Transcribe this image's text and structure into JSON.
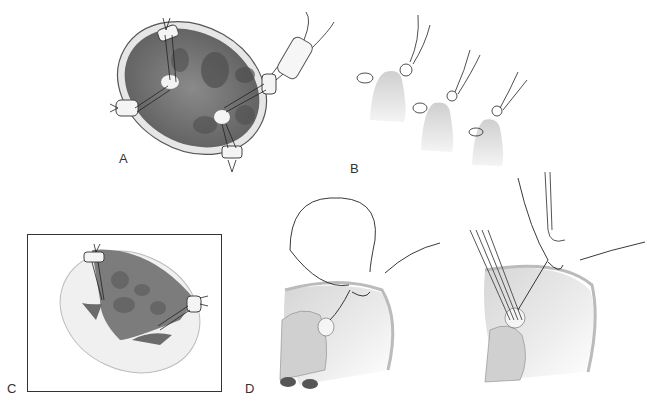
{
  "figure": {
    "panels": [
      {
        "id": "A",
        "label": "A",
        "description": "Oval valve orifice viewed from above with pledgeted sutures placed through papillary muscle heads"
      },
      {
        "id": "B",
        "label": "B",
        "description": "Three-step sequence of pledgeted suture passed through papillary muscle tip"
      },
      {
        "id": "C",
        "label": "C",
        "description": "Framed view of ventricle with pledgeted sutures anchored at annulus"
      },
      {
        "id": "D",
        "label": "D",
        "description": "Two side views of suture looped from annulus to papillary muscle with forceps"
      }
    ]
  },
  "colors": {
    "background": "#ffffff",
    "ink": "#333333",
    "tissue_dark": "#6e6e6e",
    "tissue_mid": "#9a9a9a",
    "tissue_light": "#d8d8d8",
    "frame": "#333333"
  }
}
